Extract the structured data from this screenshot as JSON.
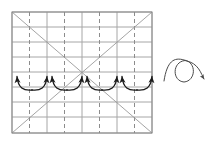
{
  "figure": {
    "title": "",
    "type": "geometric-diagram",
    "background_color": "#ffffff",
    "width": 211,
    "height": 143
  },
  "grid": {
    "name": "coordinate-grid",
    "x_left": 12,
    "x_right": 152,
    "y_top": 12,
    "y_bottom": 133,
    "border_color": "#8a8a8a",
    "border_width": 1.0,
    "solid_line_color": "#a6a6a6",
    "dashed_line_color": "#8c8c8c",
    "dash_pattern": "4,3",
    "horizontal_lines": [
      12,
      27,
      42,
      57,
      72,
      87,
      102,
      117,
      133
    ],
    "vertical_solid_lines": [
      12,
      47,
      82,
      117,
      152
    ],
    "vertical_dashed_lines": [
      29.5,
      64.5,
      99.5,
      134.5
    ],
    "columns": 4,
    "rows": 8
  },
  "diagonals": {
    "name": "diagonal-cross-lines",
    "color": "#9a9a9a",
    "width": 0.9,
    "lines": [
      {
        "label": "descending-diagonal",
        "x1": 12,
        "y1": 12,
        "x2": 152,
        "y2": 133
      },
      {
        "label": "ascending-diagonal",
        "x1": 12,
        "y1": 133,
        "x2": 152,
        "y2": 12
      }
    ]
  },
  "arcs": {
    "name": "double-headed-arc-arrows",
    "color": "#1a1a1a",
    "stroke_width": 1.3,
    "baseline_y": 76,
    "depth": 14,
    "count": 4,
    "items": [
      {
        "label": "arc-1",
        "x_start": 17,
        "x_end": 47
      },
      {
        "label": "arc-2",
        "x_start": 52,
        "x_end": 82
      },
      {
        "label": "arc-3",
        "x_start": 87,
        "x_end": 117
      },
      {
        "label": "arc-4",
        "x_start": 122,
        "x_end": 152
      }
    ]
  },
  "loop_symbol": {
    "name": "loop-arrow-annotation",
    "color": "#4a4a4a",
    "stroke_width": 1.0,
    "center_x": 184,
    "center_y": 71,
    "radius": 11,
    "arrow_end_x": 204,
    "arrow_end_y": 79,
    "description": "loop-the-loop curl with arrowhead"
  },
  "labels": {
    "axis_x": "",
    "axis_y": "",
    "caption": ""
  }
}
